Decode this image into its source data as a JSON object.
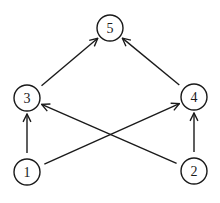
{
  "diagram": {
    "type": "directed-graph",
    "nodes": [
      {
        "id": "1",
        "label": "1",
        "x": 27,
        "y": 172
      },
      {
        "id": "2",
        "label": "2",
        "x": 194,
        "y": 171
      },
      {
        "id": "3",
        "label": "3",
        "x": 27,
        "y": 98
      },
      {
        "id": "4",
        "label": "4",
        "x": 194,
        "y": 97
      },
      {
        "id": "5",
        "label": "5",
        "x": 110,
        "y": 28
      }
    ],
    "edges": [
      {
        "from": "1",
        "to": "3"
      },
      {
        "from": "1",
        "to": "4"
      },
      {
        "from": "2",
        "to": "3"
      },
      {
        "from": "2",
        "to": "4"
      },
      {
        "from": "3",
        "to": "5"
      },
      {
        "from": "4",
        "to": "5"
      }
    ],
    "node_radius": 13,
    "stroke_color": "#1a1a1a",
    "background": "#ffffff"
  }
}
